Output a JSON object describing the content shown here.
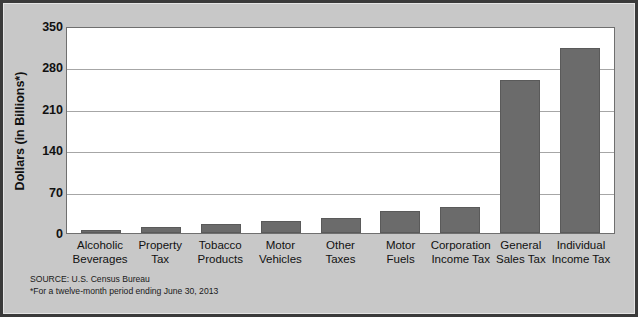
{
  "chart_data": {
    "type": "bar",
    "title": "",
    "xlabel": "",
    "ylabel": "Dollars (in Billions*)",
    "ylim": [
      0,
      350
    ],
    "yticks": [
      350,
      280,
      210,
      140,
      70,
      0
    ],
    "grid": true,
    "legend": "none",
    "bar_color": "#6b6b6b",
    "categories": [
      "Alcoholic Beverages",
      "Property Tax",
      "Tobacco Products",
      "Motor Vehicles",
      "Other Taxes",
      "Motor Fuels",
      "Corporation Income Tax",
      "General Sales Tax",
      "Individual Income Tax"
    ],
    "category_lines": [
      [
        "Alcoholic",
        "Beverages"
      ],
      [
        "Property",
        "Tax"
      ],
      [
        "Tobacco",
        "Products"
      ],
      [
        "Motor",
        "Vehicles"
      ],
      [
        "Other",
        "Taxes"
      ],
      [
        "Motor",
        "Fuels"
      ],
      [
        "Corporation",
        "Income Tax"
      ],
      [
        "General",
        "Sales Tax"
      ],
      [
        "Individual",
        "Income Tax"
      ]
    ],
    "values": [
      5,
      10,
      15,
      20,
      25,
      38,
      44,
      258,
      312
    ]
  },
  "footnote": {
    "source_line": "SOURCE: U.S. Census Bureau",
    "note_line": "*For a twelve-month period ending June 30, 2013"
  }
}
